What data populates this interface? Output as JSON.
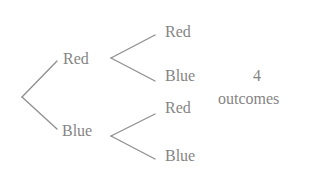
{
  "diagram": {
    "type": "tree",
    "colors": {
      "line": "#8e8e8e",
      "text": "#858585",
      "background": "#ffffff"
    },
    "level1": [
      {
        "label": "Red"
      },
      {
        "label": "Blue"
      }
    ],
    "level2": [
      {
        "parent": "Red",
        "label": "Red"
      },
      {
        "parent": "Red",
        "label": "Blue"
      },
      {
        "parent": "Blue",
        "label": "Red"
      },
      {
        "parent": "Blue",
        "label": "Blue"
      }
    ],
    "summary": {
      "count": "4",
      "caption": "outcomes"
    }
  }
}
